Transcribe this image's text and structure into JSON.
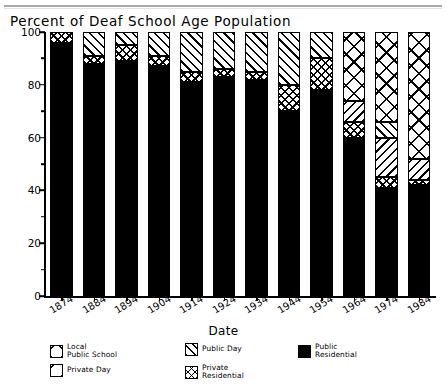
{
  "title": "Percent of Deaf School Age Population",
  "axis": {
    "xlabel": "Date",
    "y_ticks": [
      "0",
      "20",
      "40",
      "60",
      "80",
      "100"
    ],
    "y_minor_ticks": [
      "10",
      "30",
      "50",
      "70",
      "90"
    ]
  },
  "legend": {
    "items": [
      {
        "name": "local-public-school",
        "pattern": "x",
        "line1": "Local",
        "line2": "Public School"
      },
      {
        "name": "private-day",
        "pattern": "bslash",
        "line1": "Private Day",
        "line2": ""
      },
      {
        "name": "public-day",
        "pattern": "fslash",
        "line1": "Public Day",
        "line2": ""
      },
      {
        "name": "private-residential",
        "pattern": "cross",
        "line1": "Private",
        "line2": "Residential"
      },
      {
        "name": "public-residential",
        "pattern": "solid",
        "line1": "Public",
        "line2": "Residential"
      }
    ]
  },
  "chart_data": {
    "type": "bar",
    "subtype": "stacked-bar",
    "title": "Percent of Deaf School Age Population",
    "xlabel": "Date",
    "ylabel": "",
    "ylim": [
      0,
      100
    ],
    "grid": false,
    "legend_position": "below",
    "categories": [
      "1874",
      "1884",
      "1894",
      "1904",
      "1914",
      "1924",
      "1934",
      "1944",
      "1954",
      "1964",
      "1974",
      "1984"
    ],
    "series": [
      {
        "name": "Public Residential",
        "pattern": "solid",
        "values": [
          96,
          88,
          89,
          87,
          81,
          83,
          82,
          70,
          78,
          60,
          41,
          42
        ]
      },
      {
        "name": "Private Residential",
        "pattern": "cross",
        "values": [
          4,
          3,
          6,
          4,
          4,
          3,
          3,
          10,
          12,
          6,
          4,
          2
        ]
      },
      {
        "name": "Private Day",
        "pattern": "bslash",
        "values": [
          0,
          0,
          0,
          0,
          0,
          0,
          0,
          0,
          0,
          8,
          15,
          8
        ]
      },
      {
        "name": "Public Day",
        "pattern": "fslash",
        "values": [
          0,
          9,
          5,
          9,
          15,
          14,
          15,
          20,
          10,
          0,
          6,
          0
        ]
      },
      {
        "name": "Local Public School",
        "pattern": "x",
        "values": [
          0,
          0,
          0,
          0,
          0,
          0,
          0,
          0,
          0,
          26,
          34,
          48
        ]
      }
    ]
  }
}
